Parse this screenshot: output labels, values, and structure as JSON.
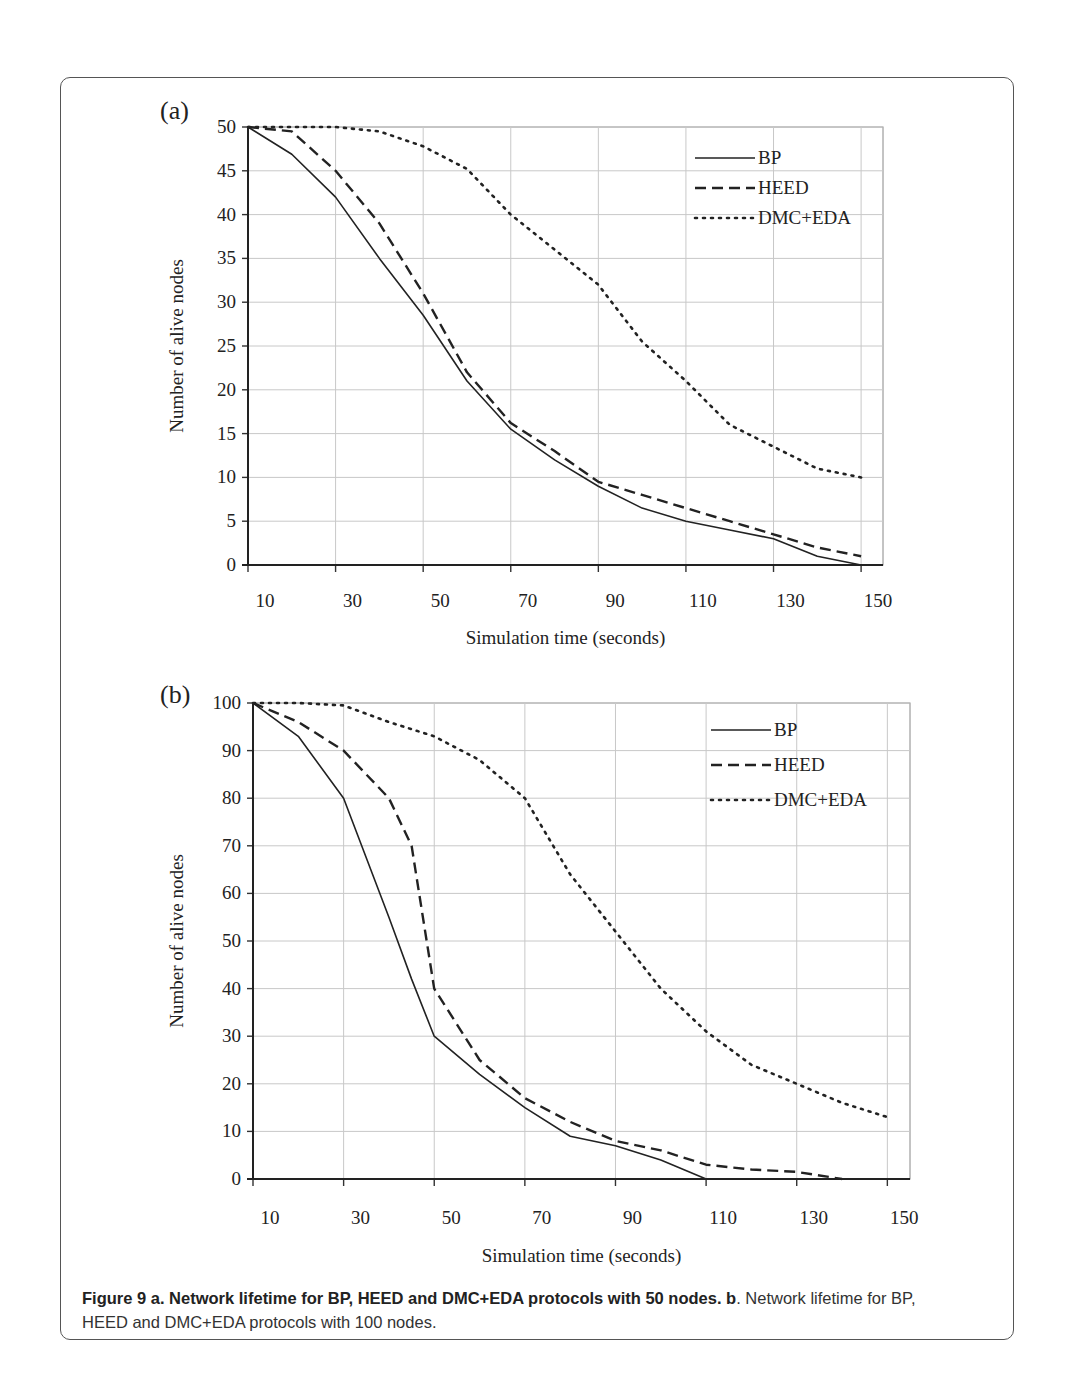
{
  "figure": {
    "caption": {
      "bold_part": "Figure 9 a. Network lifetime for BP, HEED and DMC+EDA protocols with 50 nodes. b",
      "normal_part": ". Network lifetime for BP, HEED and DMC+EDA protocols with 100 nodes."
    }
  },
  "chart_data": [
    {
      "panel_label": "(a)",
      "type": "line",
      "title": "",
      "xlabel": "Simulation time (seconds)",
      "ylabel": "Number of alive nodes",
      "x_tick_labels": [
        "10",
        "30",
        "50",
        "70",
        "90",
        "110",
        "130",
        "150"
      ],
      "y_ticks": [
        0,
        5,
        10,
        15,
        20,
        25,
        30,
        35,
        40,
        45,
        50
      ],
      "ylim": [
        0,
        50
      ],
      "xlim": [
        10,
        155
      ],
      "grid": true,
      "legend_position": "upper right",
      "x": [
        10,
        20,
        30,
        40,
        50,
        60,
        70,
        80,
        90,
        100,
        110,
        120,
        130,
        140,
        150
      ],
      "series": [
        {
          "name": "BP",
          "style": "solid",
          "values": [
            50,
            46.9,
            42,
            35,
            28.5,
            21,
            15.5,
            12,
            9,
            6.5,
            5,
            4,
            3,
            1,
            0
          ]
        },
        {
          "name": "HEED",
          "style": "dashed",
          "values": [
            50,
            49.5,
            45,
            39,
            31,
            22,
            16.2,
            13,
            9.5,
            8,
            6.5,
            5,
            3.5,
            2,
            1
          ]
        },
        {
          "name": "DMC+EDA",
          "style": "dotted",
          "values": [
            50,
            50,
            50,
            49.5,
            47.8,
            45.2,
            40,
            36,
            32,
            25.5,
            21,
            16,
            13.5,
            11,
            10
          ]
        }
      ]
    },
    {
      "panel_label": "(b)",
      "type": "line",
      "title": "",
      "xlabel": "Simulation time (seconds)",
      "ylabel": "Number of alive nodes",
      "x_tick_labels": [
        "10",
        "30",
        "50",
        "70",
        "90",
        "110",
        "130",
        "150"
      ],
      "y_ticks": [
        0,
        10,
        20,
        30,
        40,
        50,
        60,
        70,
        80,
        90,
        100
      ],
      "ylim": [
        0,
        100
      ],
      "xlim": [
        10,
        155
      ],
      "grid": true,
      "legend_position": "upper right",
      "x": [
        10,
        20,
        30,
        40,
        45,
        50,
        60,
        70,
        80,
        90,
        100,
        110,
        120,
        130,
        140,
        150
      ],
      "series": [
        {
          "name": "BP",
          "style": "solid",
          "values": [
            100,
            93,
            80,
            55,
            42,
            30,
            22,
            15,
            9,
            7,
            4,
            0,
            null,
            null,
            null,
            null
          ]
        },
        {
          "name": "HEED",
          "style": "dashed",
          "values": [
            100,
            96,
            90,
            80,
            70,
            40,
            25,
            17,
            12,
            8,
            6,
            3,
            2,
            1.5,
            0,
            null
          ]
        },
        {
          "name": "DMC+EDA",
          "style": "dotted",
          "values": [
            100,
            100,
            99.5,
            96,
            94.5,
            93,
            88,
            80,
            64,
            52,
            40,
            31,
            24,
            20,
            16,
            13
          ]
        }
      ]
    }
  ]
}
